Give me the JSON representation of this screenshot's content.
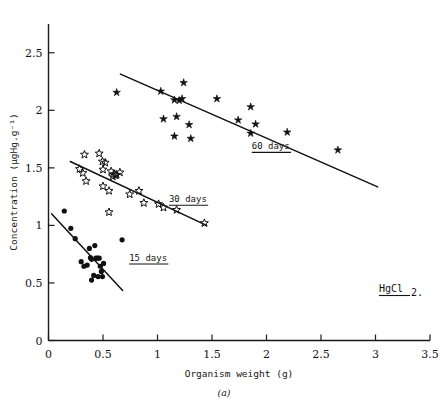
{
  "chart_data": {
    "type": "scatter",
    "title": "",
    "xlabel": "Organism weight (g)",
    "ylabel": "Concentration (µgHg.g⁻¹)",
    "xlim": [
      0,
      3.5
    ],
    "ylim": [
      0,
      2.75
    ],
    "xticks": [
      0,
      0.5,
      1,
      1.5,
      2,
      2.5,
      3,
      3.5
    ],
    "xticklabels": [
      "0",
      "0.5",
      "1",
      "1.5",
      "2",
      "2.5",
      "3",
      "3.5"
    ],
    "yticks": [
      0,
      0.5,
      1,
      1.5,
      2,
      2.5
    ],
    "yticklabels": [
      "0",
      "0.5",
      "1",
      "1.5",
      "2",
      "2.5"
    ],
    "grid": false,
    "legend_position": "inline-annotations",
    "annotations": [
      {
        "name": "treatment",
        "text": "HgCl",
        "subscript": "2.",
        "x": 3.02,
        "y": 0.88
      },
      {
        "name": "panel-caption",
        "text": "(a)"
      }
    ],
    "series": [
      {
        "name": "15 days",
        "label": "15 days",
        "marker": "filled-circle",
        "label_x": 0.74,
        "label_y": 0.695,
        "trendline": {
          "x": [
            0.03,
            0.68
          ],
          "y": [
            1.1,
            0.435
          ]
        },
        "points": [
          {
            "x": 0.145,
            "y": 1.125
          },
          {
            "x": 0.205,
            "y": 0.975
          },
          {
            "x": 0.245,
            "y": 0.885
          },
          {
            "x": 0.3,
            "y": 0.685
          },
          {
            "x": 0.325,
            "y": 0.645
          },
          {
            "x": 0.355,
            "y": 0.655
          },
          {
            "x": 0.375,
            "y": 0.8
          },
          {
            "x": 0.385,
            "y": 0.72
          },
          {
            "x": 0.395,
            "y": 0.705
          },
          {
            "x": 0.395,
            "y": 0.525
          },
          {
            "x": 0.415,
            "y": 0.565
          },
          {
            "x": 0.425,
            "y": 0.825
          },
          {
            "x": 0.435,
            "y": 0.715
          },
          {
            "x": 0.45,
            "y": 0.715
          },
          {
            "x": 0.455,
            "y": 0.555
          },
          {
            "x": 0.465,
            "y": 0.715
          },
          {
            "x": 0.475,
            "y": 0.645
          },
          {
            "x": 0.485,
            "y": 0.6
          },
          {
            "x": 0.495,
            "y": 0.555
          },
          {
            "x": 0.505,
            "y": 0.67
          },
          {
            "x": 0.675,
            "y": 0.875
          }
        ]
      },
      {
        "name": "30 days",
        "label": "30 days",
        "marker": "open-star",
        "label_x": 1.105,
        "label_y": 1.205,
        "trendline": {
          "x": [
            0.2,
            1.45
          ],
          "y": [
            1.555,
            1.0
          ]
        },
        "points": [
          {
            "x": 0.33,
            "y": 1.615
          },
          {
            "x": 0.285,
            "y": 1.49
          },
          {
            "x": 0.315,
            "y": 1.455
          },
          {
            "x": 0.345,
            "y": 1.385
          },
          {
            "x": 0.465,
            "y": 1.625
          },
          {
            "x": 0.495,
            "y": 1.555
          },
          {
            "x": 0.52,
            "y": 1.545
          },
          {
            "x": 0.5,
            "y": 1.485
          },
          {
            "x": 0.555,
            "y": 1.115
          },
          {
            "x": 0.575,
            "y": 1.47
          },
          {
            "x": 0.59,
            "y": 1.425
          },
          {
            "x": 0.6,
            "y": 1.445
          },
          {
            "x": 0.615,
            "y": 1.435
          },
          {
            "x": 0.625,
            "y": 1.44
          },
          {
            "x": 0.655,
            "y": 1.46
          },
          {
            "x": 0.5,
            "y": 1.34
          },
          {
            "x": 0.555,
            "y": 1.3
          },
          {
            "x": 0.745,
            "y": 1.27
          },
          {
            "x": 0.83,
            "y": 1.3
          },
          {
            "x": 0.875,
            "y": 1.195
          },
          {
            "x": 1.01,
            "y": 1.185
          },
          {
            "x": 1.055,
            "y": 1.155
          },
          {
            "x": 1.175,
            "y": 1.135
          },
          {
            "x": 1.43,
            "y": 1.02
          }
        ]
      },
      {
        "name": "60 days",
        "label": "60 days",
        "marker": "filled-star",
        "label_x": 1.865,
        "label_y": 1.665,
        "trendline": {
          "x": [
            0.66,
            3.02
          ],
          "y": [
            2.315,
            1.335
          ]
        },
        "points": [
          {
            "x": 0.625,
            "y": 2.155
          },
          {
            "x": 1.03,
            "y": 2.165
          },
          {
            "x": 1.24,
            "y": 2.24
          },
          {
            "x": 1.155,
            "y": 2.09
          },
          {
            "x": 1.2,
            "y": 2.085
          },
          {
            "x": 1.225,
            "y": 2.1
          },
          {
            "x": 1.055,
            "y": 1.925
          },
          {
            "x": 1.175,
            "y": 1.945
          },
          {
            "x": 1.29,
            "y": 1.875
          },
          {
            "x": 1.155,
            "y": 1.775
          },
          {
            "x": 1.305,
            "y": 1.755
          },
          {
            "x": 1.545,
            "y": 2.1
          },
          {
            "x": 1.74,
            "y": 1.915
          },
          {
            "x": 1.855,
            "y": 2.03
          },
          {
            "x": 1.9,
            "y": 1.88
          },
          {
            "x": 1.855,
            "y": 1.8
          },
          {
            "x": 2.19,
            "y": 1.81
          },
          {
            "x": 2.655,
            "y": 1.655
          }
        ]
      }
    ]
  }
}
